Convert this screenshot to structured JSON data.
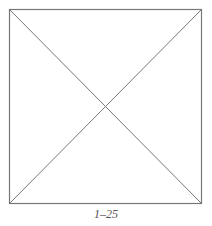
{
  "figure": {
    "caption": "1–25",
    "shape": "square-with-diagonals",
    "stroke_color": "#777777",
    "square": {
      "x1": 9.5,
      "y1": 9.5,
      "x2": 201.5,
      "y2": 203.5
    }
  }
}
